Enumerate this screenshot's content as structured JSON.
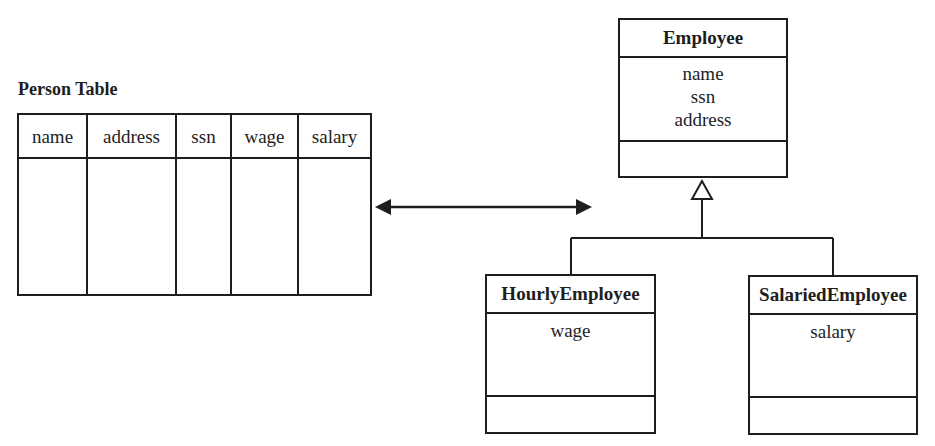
{
  "person_table": {
    "title": "Person Table",
    "columns": [
      "name",
      "address",
      "ssn",
      "wage",
      "salary"
    ]
  },
  "mapping_arrow": {
    "type": "bidirectional"
  },
  "classes": {
    "employee": {
      "name": "Employee",
      "attributes": [
        "name",
        "ssn",
        "address"
      ]
    },
    "hourly": {
      "name": "HourlyEmployee",
      "attributes": [
        "wage"
      ]
    },
    "salaried": {
      "name": "SalariedEmployee",
      "attributes": [
        "salary"
      ]
    }
  },
  "inheritance": {
    "parent": "Employee",
    "children": [
      "HourlyEmployee",
      "SalariedEmployee"
    ]
  }
}
